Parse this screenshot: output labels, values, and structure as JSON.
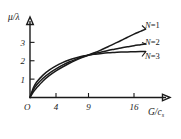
{
  "chart_data": {
    "type": "line",
    "title": "",
    "subtitle": "",
    "xlabel": "G/c",
    "xlabel_sub": "s",
    "ylabel": "μ/λ",
    "origin_label": "O",
    "xticks": [
      4,
      9,
      16
    ],
    "xtick_labels": [
      "4",
      "9",
      "16"
    ],
    "yticks": [
      1,
      2,
      3
    ],
    "ytick_labels": [
      "1",
      "2",
      "3"
    ],
    "xlim": [
      0,
      20
    ],
    "ylim": [
      0,
      4
    ],
    "grid": false,
    "legend_position": "right-inline",
    "line_color": "#1a1a1a",
    "series": [
      {
        "name": "N=1",
        "label_n": "N",
        "label_eq": "=1",
        "points": [
          [
            0,
            0
          ],
          [
            0.5,
            0.52
          ],
          [
            1,
            0.83
          ],
          [
            2,
            1.22
          ],
          [
            3,
            1.5
          ],
          [
            4,
            1.72
          ],
          [
            5,
            1.9
          ],
          [
            6,
            2.04
          ],
          [
            7,
            2.15
          ],
          [
            8,
            2.24
          ],
          [
            9,
            2.32
          ],
          [
            10,
            2.45
          ],
          [
            11,
            2.6
          ],
          [
            12,
            2.76
          ],
          [
            13,
            2.93
          ],
          [
            14,
            3.1
          ],
          [
            15,
            3.28
          ],
          [
            16,
            3.45
          ],
          [
            17,
            3.6
          ],
          [
            17.8,
            3.72
          ]
        ]
      },
      {
        "name": "N=2",
        "label_n": "N",
        "label_eq": "=2",
        "points": [
          [
            0,
            0
          ],
          [
            0.5,
            0.42
          ],
          [
            1,
            0.68
          ],
          [
            2,
            1.05
          ],
          [
            3,
            1.33
          ],
          [
            4,
            1.56
          ],
          [
            5,
            1.76
          ],
          [
            6,
            1.93
          ],
          [
            7,
            2.07
          ],
          [
            8,
            2.2
          ],
          [
            9,
            2.31
          ],
          [
            10,
            2.4
          ],
          [
            11,
            2.48
          ],
          [
            12,
            2.56
          ],
          [
            13,
            2.63
          ],
          [
            14,
            2.7
          ],
          [
            15,
            2.76
          ],
          [
            16,
            2.82
          ],
          [
            17,
            2.87
          ],
          [
            17.8,
            2.91
          ]
        ]
      },
      {
        "name": "N=3",
        "label_n": "N",
        "label_eq": "=3",
        "points": [
          [
            0,
            0
          ],
          [
            0.5,
            0.3
          ],
          [
            1,
            0.52
          ],
          [
            2,
            0.9
          ],
          [
            3,
            1.2
          ],
          [
            4,
            1.45
          ],
          [
            5,
            1.66
          ],
          [
            6,
            1.85
          ],
          [
            7,
            2.02
          ],
          [
            8,
            2.17
          ],
          [
            9,
            2.3
          ],
          [
            10,
            2.36
          ],
          [
            11,
            2.4
          ],
          [
            12,
            2.43
          ],
          [
            13,
            2.45
          ],
          [
            14,
            2.47
          ],
          [
            15,
            2.48
          ],
          [
            16,
            2.49
          ],
          [
            17,
            2.5
          ],
          [
            17.8,
            2.5
          ]
        ]
      }
    ]
  }
}
